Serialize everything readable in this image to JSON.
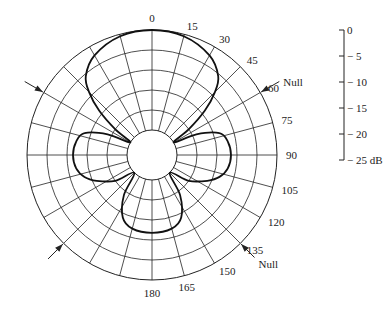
{
  "chart_data": {
    "type": "polar-line",
    "title": "",
    "angle_unit": "degrees",
    "angle_ticks": [
      0,
      15,
      30,
      45,
      60,
      75,
      90,
      105,
      120,
      135,
      150,
      165,
      180
    ],
    "angle_tick_labels": [
      "0",
      "15",
      "30",
      "45",
      "60",
      "75",
      "90",
      "105",
      "120",
      "135",
      "150",
      "165",
      "180"
    ],
    "angle_direction": "clockwise-from-top",
    "radial_scale": {
      "ticks": [
        0,
        -5,
        -10,
        -15,
        -20,
        -25
      ],
      "tick_labels": [
        "0",
        "− 5",
        "− 10",
        "− 15",
        "− 20",
        "− 25 dB"
      ],
      "range": [
        -25,
        0
      ],
      "unit": "dB"
    },
    "spoke_step_deg": 15,
    "series": [
      {
        "name": "Radiation pattern",
        "lobes": [
          {
            "name": "main-lobe",
            "center_deg": 0,
            "peak_db": 0,
            "null_deg": 60
          },
          {
            "name": "side-lobe-90",
            "center_deg": 90,
            "peak_db": -12,
            "null_deg": [
              60,
              135
            ]
          },
          {
            "name": "back-lobe-180",
            "center_deg": 180,
            "peak_db": -12,
            "null_deg": 135
          }
        ],
        "points": [
          {
            "angle": 0,
            "db": 0
          },
          {
            "angle": 15,
            "db": -0.5
          },
          {
            "angle": 30,
            "db": -2.5
          },
          {
            "angle": 40,
            "db": -5.5
          },
          {
            "angle": 45,
            "db": -9
          },
          {
            "angle": 50,
            "db": -14
          },
          {
            "angle": 55,
            "db": -20
          },
          {
            "angle": 60,
            "db": -25
          },
          {
            "angle": 65,
            "db": -19
          },
          {
            "angle": 72,
            "db": -13.5
          },
          {
            "angle": 80,
            "db": -12
          },
          {
            "angle": 90,
            "db": -11.5
          },
          {
            "angle": 100,
            "db": -12
          },
          {
            "angle": 108,
            "db": -13.5
          },
          {
            "angle": 115,
            "db": -16
          },
          {
            "angle": 125,
            "db": -20
          },
          {
            "angle": 135,
            "db": -25
          },
          {
            "angle": 145,
            "db": -19
          },
          {
            "angle": 155,
            "db": -14
          },
          {
            "angle": 165,
            "db": -12.2
          },
          {
            "angle": 180,
            "db": -11.8
          }
        ],
        "symmetric_about": "0-180 axis"
      }
    ],
    "annotations": [
      {
        "text": "Null",
        "angle": 60,
        "side": "right"
      },
      {
        "text": "Null",
        "angle": 135,
        "side": "right"
      },
      {
        "text": "",
        "angle": 300,
        "side": "left",
        "marker": "arrow"
      },
      {
        "text": "",
        "angle": 225,
        "side": "left",
        "marker": "arrow"
      }
    ],
    "grid": true,
    "legend": "none"
  },
  "labels": {
    "null_upper": "Null",
    "null_lower": "Null"
  }
}
